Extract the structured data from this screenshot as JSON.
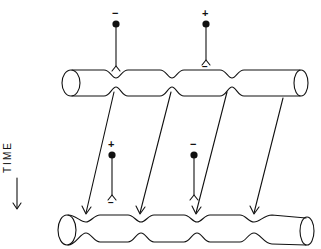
{
  "diagram": {
    "type": "schematic",
    "time_axis": {
      "label": "TIME",
      "direction": "down"
    },
    "top_strand": {
      "markers": [
        {
          "sign": "−",
          "label_below": ""
        },
        {
          "sign": "+",
          "label_below": "−"
        }
      ]
    },
    "bottom_strand": {
      "markers": [
        {
          "sign": "+",
          "label_below": "−"
        },
        {
          "sign": "−",
          "label_below": ""
        }
      ]
    },
    "arrows_count": 4,
    "colors": {
      "ink": "#111111",
      "background": "#ffffff"
    }
  }
}
